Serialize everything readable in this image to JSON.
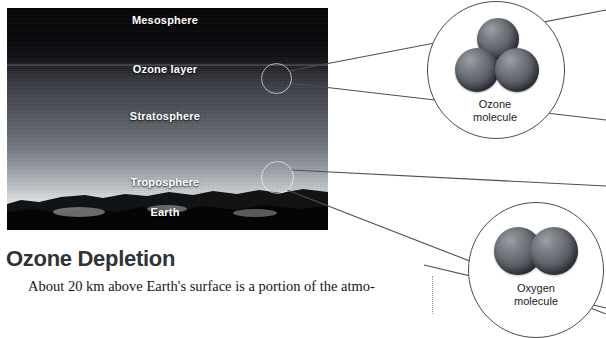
{
  "figure": {
    "photo": {
      "alt_name": "atmosphere-cross-section-photo",
      "layers": [
        {
          "id": "mesosphere",
          "label": "Mesosphere"
        },
        {
          "id": "ozone-layer",
          "label": "Ozone layer"
        },
        {
          "id": "stratosphere",
          "label": "Stratosphere"
        },
        {
          "id": "troposphere",
          "label": "Troposphere"
        },
        {
          "id": "earth",
          "label": "Earth"
        }
      ]
    },
    "callouts": [
      {
        "id": "ozone-molecule",
        "caption_line1": "Ozone",
        "caption_line2": "molecule",
        "atom_count": 3,
        "source_layer": "ozone-layer"
      },
      {
        "id": "oxygen-molecule",
        "caption_line1": "Oxygen",
        "caption_line2": "molecule",
        "atom_count": 2,
        "source_layer": "troposphere"
      }
    ]
  },
  "article": {
    "heading": "Ozone Depletion",
    "paragraph": "About 20 km above Earth's surface is a portion of the atmo-"
  },
  "colors": {
    "heading": "#2f3336",
    "label_text": "#ffffff",
    "callout_stroke": "#4a4a4a",
    "sphere_mid": "#62666d",
    "page_background": "#ffffff"
  }
}
